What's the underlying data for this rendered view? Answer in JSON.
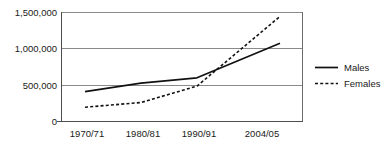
{
  "chart_data": {
    "type": "line",
    "title": "",
    "subtitle": "",
    "xlabel": "",
    "ylabel": "",
    "categories": [
      "1970/71",
      "1980/81",
      "1990/91",
      "2004/05"
    ],
    "series": [
      {
        "name": "Males",
        "values": [
          405000,
          520000,
          595000,
          1070000
        ],
        "style": "solid"
      },
      {
        "name": "Females",
        "values": [
          190000,
          255000,
          480000,
          1440000
        ],
        "style": "dotted"
      }
    ],
    "ylim": [
      0,
      1500000
    ],
    "yticks": [
      0,
      500000,
      1000000,
      1500000
    ],
    "ytick_labels": [
      "0",
      "500,000",
      "1,000,000",
      "1,500,000"
    ],
    "xtick_labels": [
      "1970/71",
      "1980/81",
      "1990/91",
      "2004/05"
    ],
    "grid": true,
    "grid_axis": "y",
    "legend_position": "right",
    "legend_entries": [
      "Males",
      "Females"
    ]
  },
  "axes": {
    "y_labels": [
      "1,500,000",
      "1,000,000",
      "500,000",
      "0"
    ],
    "x_labels": [
      "1970/71",
      "1980/81",
      "1990/91",
      "2004/05"
    ]
  },
  "legend": {
    "items": [
      {
        "label": "Males"
      },
      {
        "label": "Females"
      }
    ]
  },
  "colors": {
    "line": "#111111",
    "grid": "#8a8a8a",
    "frame": "#6b6b6b",
    "background": "#ffffff",
    "text": "#1a1a1a"
  }
}
